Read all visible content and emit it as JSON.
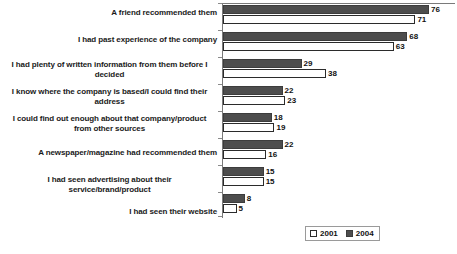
{
  "chart_data": {
    "type": "bar",
    "orientation": "horizontal",
    "title": "",
    "xlabel": "",
    "ylabel": "",
    "xlim": [
      0,
      80
    ],
    "grid": false,
    "legend_position": "bottom-right",
    "categories": [
      "A friend recommended them",
      "I had past experience of the company",
      "I had plenty of written information from them before I decided",
      "I know where the company is based/I could find their address",
      "I could find out enough about that company/product from other sources",
      "A newspaper/magazine had recommended them",
      "I had seen advertising about their service/brand/product",
      "I had seen their website"
    ],
    "series": [
      {
        "name": "2001",
        "color": "#ffffff",
        "values": [
          71,
          63,
          38,
          23,
          19,
          16,
          15,
          5
        ]
      },
      {
        "name": "2004",
        "color": "#4d4d4d",
        "values": [
          76,
          68,
          29,
          22,
          18,
          22,
          15,
          8
        ]
      }
    ]
  },
  "legend": {
    "items": [
      {
        "label": "2001",
        "swatch": "white-square-icon"
      },
      {
        "label": "2004",
        "swatch": "dark-square-icon"
      }
    ]
  }
}
